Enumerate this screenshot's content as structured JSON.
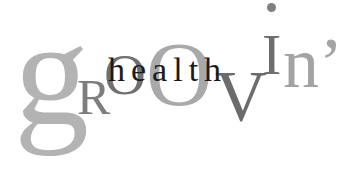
{
  "logo": {
    "letters": {
      "g": "g",
      "R": "R",
      "O1": "O",
      "O2": "O",
      "V": "V",
      "I": "I",
      "n": "n’"
    },
    "word_main": "groovin’",
    "word_overlay": "health",
    "colors": {
      "light_gray": "#b3b3b3",
      "mid_gray": "#7d7d7d",
      "dark_gray": "#6c6c6c",
      "black": "#1a1a1a",
      "background": "#ffffff"
    }
  }
}
